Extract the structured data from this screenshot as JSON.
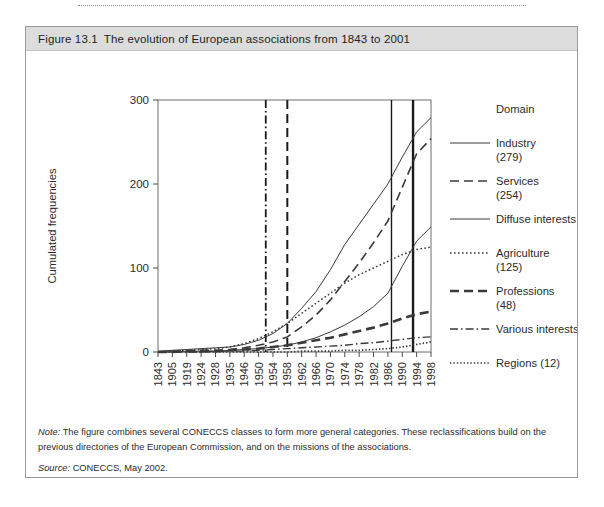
{
  "figure": {
    "number": "Figure 13.1",
    "title": "The evolution of European associations from 1843 to 2001"
  },
  "notes": {
    "note_label": "Note:",
    "note_text": " The figure combines several CONECCS classes to form more general categories. These reclassifications build on the previous directories of the European Commission, and on the missions of the associations.",
    "source_label": "Source:",
    "source_text": " CONECCS, May 2002."
  },
  "legend": {
    "title": "Domain",
    "items": [
      {
        "label": "Industry",
        "count": "(279)",
        "style": "solid-thin",
        "two_line": true
      },
      {
        "label": "Services",
        "count": "(254)",
        "style": "dashed",
        "two_line": true
      },
      {
        "label": "Diffuse interests (149)",
        "count": "",
        "style": "solid-thin",
        "two_line": false
      },
      {
        "label": "Agriculture",
        "count": "(125)",
        "style": "dotted",
        "two_line": true
      },
      {
        "label": "Professions",
        "count": "(48)",
        "style": "dashed-thick",
        "two_line": true
      },
      {
        "label": "Various interests (18)",
        "count": "",
        "style": "dash-dot",
        "two_line": false
      },
      {
        "label": "Regions (12)",
        "count": "",
        "style": "dotted-fine",
        "two_line": false
      }
    ]
  },
  "key": {
    "label": "Key:",
    "events": [
      {
        "name": "ECSC 1952",
        "style": "dash-dot",
        "year": 1952
      },
      {
        "name": "EEC 1958",
        "style": "dashed",
        "year": 1958
      },
      {
        "name": "SEA 1987",
        "style": "solid-thin",
        "year": 1987
      },
      {
        "name": "EMU 1993",
        "style": "solid-thick",
        "year": 1993
      }
    ]
  },
  "chart_data": {
    "type": "line",
    "title": "The evolution of European associations from 1843 to 2001",
    "xlabel": "Year of foundation",
    "ylabel": "Cumulated frequencies",
    "ylim": [
      0,
      300
    ],
    "yticks": [
      0,
      100,
      200,
      300
    ],
    "grid": false,
    "legend_position": "right",
    "categories": [
      "1843",
      "1905",
      "1919",
      "1924",
      "1928",
      "1935",
      "1946",
      "1950",
      "1954",
      "1958",
      "1962",
      "1966",
      "1970",
      "1974",
      "1978",
      "1982",
      "1986",
      "1990",
      "1994",
      "1998"
    ],
    "x_tick_labels": [
      "1843",
      "1905",
      "1919",
      "1924",
      "1928",
      "1935",
      "1946",
      "1950",
      "1954",
      "1958",
      "1962",
      "1966",
      "1970",
      "1974",
      "1978",
      "1982",
      "1986",
      "1990",
      "1994",
      "1998"
    ],
    "vlines": [
      {
        "label": "ECSC 1952",
        "year": 1952,
        "style": "dash-dot"
      },
      {
        "label": "EEC 1958",
        "year": 1958,
        "style": "dashed"
      },
      {
        "label": "SEA 1987",
        "year": 1987,
        "style": "solid-thin"
      },
      {
        "label": "EMU 1993",
        "year": 1993,
        "style": "solid-thick"
      }
    ],
    "series": [
      {
        "name": "Industry",
        "final_value": 279,
        "style": "solid-thin",
        "values": [
          1,
          2,
          3,
          4,
          5,
          6,
          9,
          14,
          22,
          34,
          52,
          72,
          98,
          128,
          152,
          176,
          200,
          232,
          262,
          279
        ]
      },
      {
        "name": "Services",
        "final_value": 254,
        "style": "dashed",
        "values": [
          0,
          1,
          1,
          2,
          2,
          3,
          5,
          8,
          12,
          18,
          30,
          44,
          62,
          84,
          106,
          130,
          156,
          196,
          236,
          254
        ]
      },
      {
        "name": "Diffuse interests",
        "final_value": 149,
        "style": "solid-thin",
        "values": [
          0,
          0,
          1,
          1,
          1,
          2,
          3,
          4,
          6,
          8,
          12,
          17,
          24,
          32,
          42,
          54,
          70,
          102,
          132,
          149
        ]
      },
      {
        "name": "Agriculture",
        "final_value": 125,
        "style": "dotted",
        "values": [
          0,
          1,
          2,
          3,
          4,
          6,
          10,
          16,
          24,
          34,
          46,
          58,
          70,
          82,
          92,
          100,
          108,
          116,
          122,
          125
        ]
      },
      {
        "name": "Professions",
        "final_value": 48,
        "style": "dashed-thick",
        "values": [
          0,
          0,
          1,
          1,
          1,
          2,
          3,
          4,
          6,
          8,
          11,
          14,
          17,
          21,
          25,
          29,
          34,
          40,
          45,
          48
        ]
      },
      {
        "name": "Various interests",
        "final_value": 18,
        "style": "dash-dot",
        "values": [
          0,
          0,
          0,
          0,
          1,
          1,
          1,
          2,
          3,
          4,
          5,
          6,
          7,
          8,
          10,
          11,
          13,
          15,
          17,
          18
        ]
      },
      {
        "name": "Regions",
        "final_value": 12,
        "style": "dotted-fine",
        "values": [
          0,
          0,
          0,
          0,
          0,
          0,
          0,
          0,
          0,
          0,
          1,
          1,
          1,
          2,
          2,
          3,
          4,
          6,
          9,
          12
        ]
      }
    ]
  }
}
